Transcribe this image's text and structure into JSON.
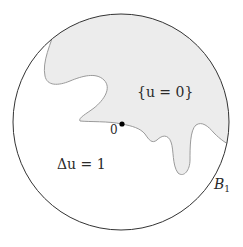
{
  "diagram": {
    "type": "free-boundary-illustration",
    "ball": {
      "label_main": "B",
      "label_sub": "1",
      "center": [
        121,
        122
      ],
      "radius": 108,
      "stroke_color": "#333333"
    },
    "zero_set": {
      "label": "{u = 0}",
      "fill_color": "#ececec",
      "stroke_color": "#9a9a9a"
    },
    "origin": {
      "label": "0",
      "point": [
        122,
        124
      ],
      "dot_color": "#000000"
    },
    "equation": {
      "label": "Δu = 1"
    }
  }
}
